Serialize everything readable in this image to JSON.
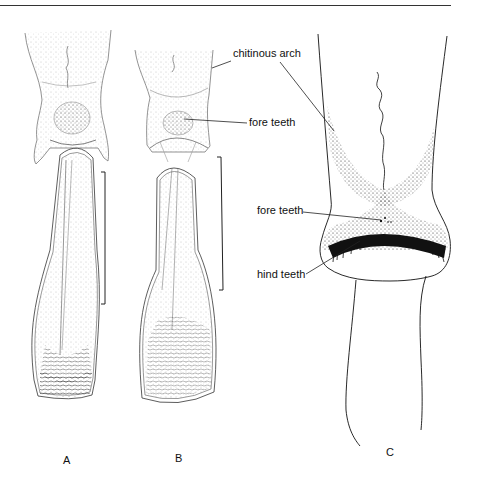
{
  "figure": {
    "panels": [
      {
        "id": "A",
        "label": "A"
      },
      {
        "id": "B",
        "label": "B"
      },
      {
        "id": "C",
        "label": "C"
      }
    ],
    "annotations": {
      "chitinous_arch": "chitinous arch",
      "fore_teeth_b": "fore teeth",
      "fore_teeth_c": "fore teeth",
      "hind_teeth": "hind teeth"
    },
    "scale_bars": [
      {
        "panel": "A",
        "x": 105,
        "y1": 172,
        "y2": 304
      },
      {
        "panel": "B",
        "x": 222,
        "y1": 157,
        "y2": 290
      }
    ]
  }
}
